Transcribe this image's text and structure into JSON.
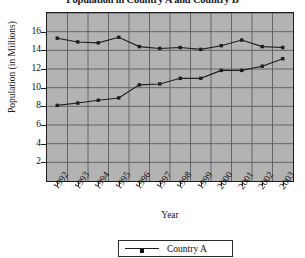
{
  "chart_data": {
    "type": "line",
    "title": "Population in Country A and Country B",
    "xlabel": "Year",
    "ylabel": "Population (in Millions)",
    "categories": [
      "1992",
      "1993",
      "1994",
      "1995",
      "1996",
      "1997",
      "1998",
      "1999",
      "2000",
      "2001",
      "2002",
      "2003"
    ],
    "xtick_labels": [
      "1992",
      "1993",
      "1994",
      "1995",
      "1996",
      "1997",
      "1998",
      "1999",
      "2000",
      "2001",
      "2002",
      "2003"
    ],
    "ytick_labels": [
      "2",
      "4",
      "6",
      "8",
      "10",
      "12",
      "14",
      "16"
    ],
    "ytick_values": [
      2,
      4,
      6,
      8,
      10,
      12,
      14,
      16
    ],
    "ylim": [
      0,
      18
    ],
    "grid": true,
    "legend_position": "bottom",
    "series": [
      {
        "name": "Country A",
        "marker": "square",
        "color": "#1d1d1d",
        "values": [
          15.3,
          14.9,
          14.8,
          15.4,
          14.4,
          14.2,
          14.3,
          14.1,
          14.5,
          15.1,
          14.4,
          14.3
        ]
      },
      {
        "name": "Country B",
        "marker": "square",
        "color": "#1d1d1d",
        "values": [
          8.1,
          8.35,
          8.65,
          8.9,
          10.3,
          10.4,
          11.0,
          11.0,
          11.85,
          11.85,
          12.3,
          13.1
        ]
      }
    ]
  },
  "legend": {
    "entries": [
      {
        "label": "Country A",
        "icon": "line-with-square-marker"
      }
    ]
  }
}
